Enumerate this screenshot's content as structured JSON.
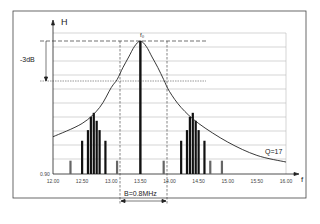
{
  "chart_data": {
    "type": "line",
    "title": "",
    "xlabel": "f",
    "ylabel": "H",
    "xlim": [
      12.0,
      16.0
    ],
    "x_ticks": [
      "12.00",
      "12.50",
      "13.00",
      "13.50",
      "14.00",
      "14.50",
      "15.00",
      "15.50",
      "16.00"
    ],
    "y_min_label": "0.90",
    "grid": "horizontal",
    "center_label": "f₀",
    "center_freq": 13.5,
    "attenuation_label": "-3dB",
    "bandwidth_label": "B=0.8MHz",
    "band_edges": [
      13.1,
      13.9
    ],
    "q_label": "Q=17",
    "resonance_curve": {
      "x": [
        12.0,
        12.5,
        12.8,
        13.0,
        13.1,
        13.2,
        13.3,
        13.4,
        13.5,
        13.6,
        13.7,
        13.8,
        13.9,
        14.0,
        14.2,
        14.5,
        15.0,
        15.5,
        16.0
      ],
      "y": [
        0.28,
        0.38,
        0.5,
        0.65,
        0.71,
        0.8,
        0.88,
        0.96,
        1.0,
        0.96,
        0.88,
        0.8,
        0.71,
        0.62,
        0.5,
        0.38,
        0.24,
        0.14,
        0.09
      ]
    },
    "spectral_lines": {
      "x": [
        12.3,
        12.5,
        12.6,
        12.65,
        12.7,
        12.75,
        12.8,
        12.9,
        13.1,
        13.5,
        13.9,
        14.2,
        14.3,
        14.35,
        14.4,
        14.45,
        14.5,
        14.6,
        14.7,
        14.9
      ],
      "y": [
        0.1,
        0.25,
        0.33,
        0.43,
        0.46,
        0.4,
        0.33,
        0.25,
        0.1,
        1.0,
        0.1,
        0.25,
        0.33,
        0.43,
        0.46,
        0.4,
        0.33,
        0.25,
        0.1,
        0.1
      ]
    }
  }
}
